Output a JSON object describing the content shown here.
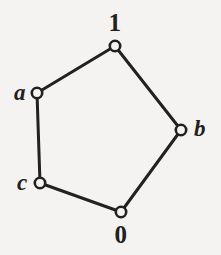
{
  "figure": {
    "background_color": "#f4f3f1",
    "stroke_color": "#232020",
    "node_fill_color": "#f4f3f1",
    "width": 221,
    "height": 255
  },
  "chart_data": {
    "type": "diagram",
    "subtype": "node-link-graph",
    "title": "",
    "xlabel": "",
    "ylabel": "",
    "grid": false,
    "legend": null,
    "nodes": [
      {
        "id": "one",
        "label": "1",
        "label_style": "numeral",
        "x": 115,
        "y": 46,
        "label_x": 115,
        "label_y": 22
      },
      {
        "id": "a",
        "label": "a",
        "label_style": "letter",
        "x": 37,
        "y": 93,
        "label_x": 20,
        "label_y": 92
      },
      {
        "id": "b",
        "label": "b",
        "label_style": "letter",
        "x": 181,
        "y": 130,
        "label_x": 200,
        "label_y": 128
      },
      {
        "id": "c",
        "label": "c",
        "label_style": "letter",
        "x": 40,
        "y": 183,
        "label_x": 22,
        "label_y": 182
      },
      {
        "id": "zero",
        "label": "0",
        "label_style": "numeral",
        "x": 121,
        "y": 212,
        "label_x": 121,
        "label_y": 234
      }
    ],
    "edges": [
      {
        "from": "a",
        "to": "one"
      },
      {
        "from": "one",
        "to": "b"
      },
      {
        "from": "b",
        "to": "zero"
      },
      {
        "from": "zero",
        "to": "c"
      },
      {
        "from": "c",
        "to": "a"
      }
    ],
    "node_radius": 5.2,
    "node_stroke_width": 2.6,
    "edge_stroke_width": 3.0
  },
  "labels": {
    "one": "1",
    "a": "a",
    "b": "b",
    "c": "c",
    "zero": "0"
  }
}
